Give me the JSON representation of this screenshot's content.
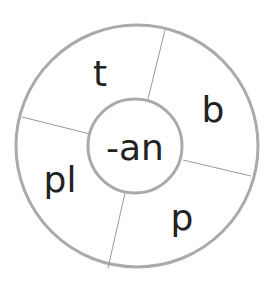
{
  "center": {
    "text": "-an"
  },
  "segments": [
    {
      "text": "t"
    },
    {
      "text": "b"
    },
    {
      "text": "p"
    },
    {
      "text": "pl"
    }
  ],
  "colors": {
    "stroke": "#a8a8a8",
    "text": "#222222"
  }
}
